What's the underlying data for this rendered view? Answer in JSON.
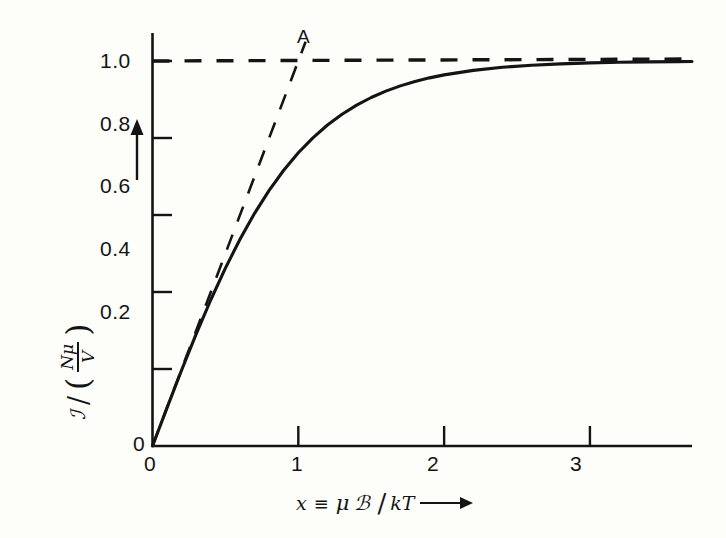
{
  "figure": {
    "background_color": "#fdfdfa",
    "ink_color": "#141414"
  },
  "chart_data": {
    "type": "line",
    "title": "",
    "subtitle": "",
    "xlabel": "x ≡ μℬ / kT",
    "ylabel": "ℐ / ( Nμ/V )",
    "xlim": [
      0,
      3.7
    ],
    "ylim": [
      0,
      1.08
    ],
    "grid": false,
    "legend": null,
    "x_ticks": [
      {
        "value": 0,
        "label": "0"
      },
      {
        "value": 1,
        "label": "1"
      },
      {
        "value": 2,
        "label": "2"
      },
      {
        "value": 3,
        "label": "3"
      }
    ],
    "y_ticks": [
      {
        "value": 0.0,
        "label": "0"
      },
      {
        "value": 0.2,
        "label": "0.2"
      },
      {
        "value": 0.4,
        "label": "0.4"
      },
      {
        "value": 0.6,
        "label": "0.6"
      },
      {
        "value": 0.8,
        "label": "0.8"
      },
      {
        "value": 1.0,
        "label": "1.0"
      }
    ],
    "series": [
      {
        "name": "tanh(x)",
        "style": "solid",
        "x": [
          0.0,
          0.1,
          0.2,
          0.3,
          0.4,
          0.5,
          0.6,
          0.7,
          0.8,
          0.9,
          1.0,
          1.1,
          1.2,
          1.3,
          1.4,
          1.5,
          1.6,
          1.7,
          1.8,
          1.9,
          2.0,
          2.2,
          2.4,
          2.6,
          2.8,
          3.0,
          3.2,
          3.4,
          3.6,
          3.7
        ],
        "values": [
          0.0,
          0.0997,
          0.1974,
          0.2913,
          0.3799,
          0.4621,
          0.537,
          0.6044,
          0.664,
          0.7163,
          0.7616,
          0.8005,
          0.8337,
          0.8617,
          0.8854,
          0.9052,
          0.9217,
          0.9354,
          0.9468,
          0.9562,
          0.964,
          0.9757,
          0.9837,
          0.989,
          0.9926,
          0.9951,
          0.9967,
          0.9978,
          0.9985,
          0.9988
        ]
      },
      {
        "name": "initial-slope tangent y = x",
        "style": "dashed",
        "x": [
          0.0,
          1.05
        ],
        "values": [
          0.0,
          1.05
        ]
      },
      {
        "name": "saturation asymptote y = 1",
        "style": "dashed",
        "x": [
          0.0,
          3.7
        ],
        "values": [
          1.0,
          1.0
        ]
      }
    ],
    "annotations": [
      {
        "label": "A",
        "x": 1.0,
        "y": 1.0,
        "note": "intersection of tangent and saturation asymptote"
      }
    ]
  },
  "axis_arrows": {
    "y_arrow": "up-arrow",
    "x_arrow": "right-arrow"
  },
  "ylabel_parts": {
    "numerator_symbol": "ℐ",
    "slash": "/",
    "open_paren": "(",
    "frac_numerator": "Nμ",
    "frac_denominator": "V",
    "close_paren": ")"
  },
  "xlabel_parts": {
    "variable": "x",
    "equiv": "≡",
    "mu": "μ",
    "script_b": "ℬ",
    "slash": "/",
    "kt": "kT"
  },
  "point_a": {
    "label": "A"
  }
}
